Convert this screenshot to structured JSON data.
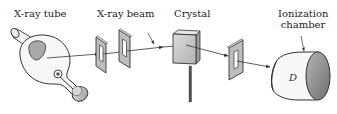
{
  "diagram": {
    "labels": {
      "xray_tube": "X-ray tube",
      "xray_beam": "X-ray beam",
      "crystal": "Crystal",
      "ionization_chamber_line1": "Ionization",
      "ionization_chamber_line2": "chamber",
      "detector_symbol": "D"
    },
    "components": [
      {
        "id": "xray-tube",
        "label": "X-ray tube"
      },
      {
        "id": "slit-1",
        "label": ""
      },
      {
        "id": "slit-2",
        "label": ""
      },
      {
        "id": "crystal",
        "label": "Crystal"
      },
      {
        "id": "slit-3",
        "label": ""
      },
      {
        "id": "ionization-chamber",
        "label": "Ionization chamber",
        "symbol": "D"
      }
    ],
    "colors": {
      "line": "#333333",
      "fill_light": "#f4f4f4",
      "fill_mid": "#c8c8c8",
      "fill_dark": "#8a8a8a",
      "background": "#ffffff"
    }
  }
}
